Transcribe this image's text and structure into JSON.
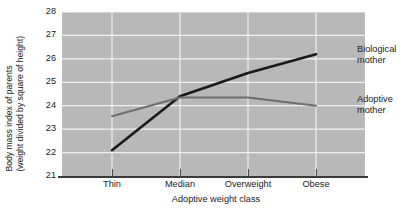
{
  "chart_data": {
    "type": "line",
    "title": "",
    "subtitle": "",
    "xlabel": "Adoptive weight class",
    "ylabel": "Body mass index of parents (weight divided by square of height)",
    "ylabel_line1": "Body mass index of parents",
    "ylabel_line2": "(weight divided by square of height)",
    "categories": [
      "Thin",
      "Median",
      "Overweight",
      "Obese"
    ],
    "yticks": [
      21,
      22,
      23,
      24,
      25,
      26,
      27,
      28
    ],
    "ylim": [
      21,
      28
    ],
    "grid": true,
    "legend_position": "inline-right-annotations",
    "plot_background": "#b8b8b8",
    "gridline_color": "#f0f0f0",
    "series": [
      {
        "name": "Biological mother",
        "label_line1": "Biological",
        "label_line2": "mother",
        "color": "#1a1a1a",
        "width": 2.6,
        "values": [
          22.1,
          24.4,
          25.4,
          26.2
        ]
      },
      {
        "name": "Adoptive mother",
        "label_line1": "Adoptive",
        "label_line2": "mother",
        "color": "#6e6e6e",
        "width": 2.0,
        "values": [
          23.55,
          24.35,
          24.35,
          24.0
        ]
      }
    ]
  },
  "axis": {
    "x_tick_labels": [
      "Thin",
      "Median",
      "Overweight",
      "Obese"
    ],
    "y_tick_labels": [
      "28",
      "27",
      "26",
      "25",
      "24",
      "23",
      "22",
      "21"
    ]
  },
  "annotations": {
    "biological": {
      "line1": "Biological",
      "line2": "mother"
    },
    "adoptive": {
      "line1": "Adoptive",
      "line2": "mother"
    }
  }
}
